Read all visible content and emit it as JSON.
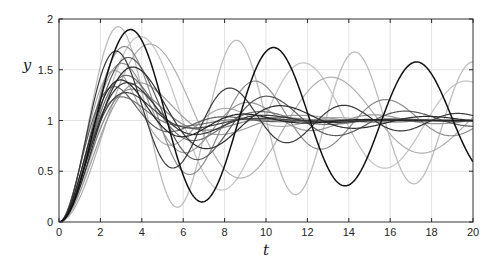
{
  "figure": {
    "background": "#ffffff"
  },
  "axes": {
    "box_color": "#333333",
    "tick_color": "#262626",
    "tick_label_color": "#262626",
    "grid_color": "#e3e3e3",
    "axis_label_color": "#1a1a1a"
  },
  "chart_data": {
    "type": "line",
    "title": "",
    "xlabel": "t",
    "ylabel": "y",
    "xlim": [
      0,
      20
    ],
    "ylim": [
      0,
      2
    ],
    "x_ticks": [
      0,
      2,
      4,
      6,
      8,
      10,
      12,
      14,
      16,
      18,
      20
    ],
    "x_tick_labels": [
      "0",
      "2",
      "4",
      "6",
      "8",
      "10",
      "12",
      "14",
      "16",
      "18",
      "20"
    ],
    "y_ticks": [
      0,
      0.5,
      1,
      1.5,
      2
    ],
    "y_tick_labels": [
      "0",
      "0.5",
      "1",
      "1.5",
      "2"
    ],
    "grid": true,
    "legend_position": "none",
    "model": "y(t) = 1 - exp(-zeta*wn*t)*(cos(wd*t) + (zeta/sqrt(1-zeta^2))*sin(wd*t)), wd = wn*sqrt(1-zeta^2)",
    "sample_step": 0.04,
    "series": [
      {
        "name": "trace-1",
        "zeta": 0.06,
        "wn": 0.8,
        "color": "#c6c6c6",
        "width": 1.3
      },
      {
        "name": "trace-2",
        "zeta": 0.025,
        "wn": 1.1,
        "color": "#bdbdbd",
        "width": 1.3
      },
      {
        "name": "trace-3",
        "zeta": 0.09,
        "wn": 0.72,
        "color": "#b0b0b0",
        "width": 1.2
      },
      {
        "name": "trace-4",
        "zeta": 0.22,
        "wn": 1.2,
        "color": "#ababab",
        "width": 1.2
      },
      {
        "name": "trace-5",
        "zeta": 0.3,
        "wn": 0.85,
        "color": "#9e9e9e",
        "width": 1.2
      },
      {
        "name": "trace-6",
        "zeta": 0.18,
        "wn": 1.05,
        "color": "#979797",
        "width": 1.2
      },
      {
        "name": "trace-7",
        "zeta": 0.1,
        "wn": 1.0,
        "color": "#8c8c8c",
        "width": 1.2
      },
      {
        "name": "trace-8",
        "zeta": 0.35,
        "wn": 0.95,
        "color": "#848484",
        "width": 1.2
      },
      {
        "name": "trace-9",
        "zeta": 0.42,
        "wn": 1.15,
        "color": "#787878",
        "width": 1.2
      },
      {
        "name": "trace-10",
        "zeta": 0.25,
        "wn": 1.0,
        "color": "#6f6f6f",
        "width": 1.2
      },
      {
        "name": "trace-11",
        "zeta": 0.33,
        "wn": 1.25,
        "color": "#616161",
        "width": 1.2
      },
      {
        "name": "trace-12",
        "zeta": 0.15,
        "wn": 0.95,
        "color": "#5a5a5a",
        "width": 1.2
      },
      {
        "name": "trace-13",
        "zeta": 0.38,
        "wn": 1.05,
        "color": "#454545",
        "width": 1.2
      },
      {
        "name": "trace-14",
        "zeta": 0.12,
        "wn": 1.15,
        "color": "#3a3a3a",
        "width": 1.2
      },
      {
        "name": "trace-15",
        "zeta": 0.3,
        "wn": 1.0,
        "color": "#353535",
        "width": 1.2
      },
      {
        "name": "trace-16",
        "zeta": 0.2,
        "wn": 0.9,
        "color": "#2e2e2e",
        "width": 1.2
      },
      {
        "name": "trace-17",
        "zeta": 0.28,
        "wn": 1.1,
        "color": "#242424",
        "width": 1.2
      },
      {
        "name": "trace-18",
        "zeta": 0.035,
        "wn": 0.91,
        "color": "#111111",
        "width": 1.5
      }
    ]
  }
}
